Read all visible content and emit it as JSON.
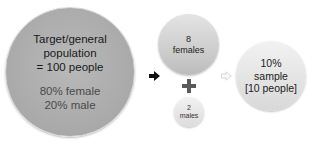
{
  "population": {
    "title_lines": [
      "Target/general",
      "population",
      "= 100 people"
    ],
    "split_lines": [
      "80% female",
      "20% male"
    ]
  },
  "females": {
    "lines": [
      "8",
      "females"
    ]
  },
  "males": {
    "lines": [
      "2",
      "males"
    ]
  },
  "sample": {
    "lines": [
      "10%",
      "sample",
      "[10 people]"
    ]
  },
  "icons": {
    "arrow_1": "arrow-right-solid",
    "plus": "plus",
    "arrow_2": "arrow-right-outline"
  },
  "colors": {
    "big_circle": "#aaaaaa",
    "mid_circle": "#cccccc",
    "light_circle": "#e4e4e4",
    "arrow_dark": "#111111",
    "arrow_light": "#dddddd"
  }
}
